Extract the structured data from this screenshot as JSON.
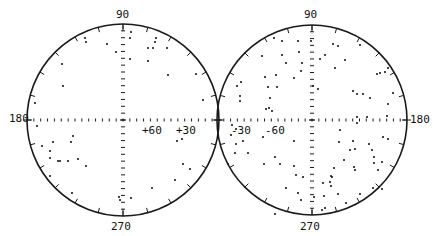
{
  "figure": {
    "colors": {
      "ink": "#1a1a1a",
      "background": "#ffffff"
    },
    "panels": [
      {
        "id": "left",
        "center": [
          123,
          120
        ],
        "radius": 96,
        "labels": {
          "top": "90",
          "bottom": "270",
          "left": "180",
          "lat_a": "+60",
          "lat_b": "+30"
        },
        "points": [
          [
            85,
            38
          ],
          [
            86,
            42
          ],
          [
            107,
            44
          ],
          [
            116,
            52
          ],
          [
            62,
            64
          ],
          [
            63,
            86
          ],
          [
            35,
            103
          ],
          [
            131,
            32
          ],
          [
            130,
            38
          ],
          [
            156,
            38
          ],
          [
            155,
            42
          ],
          [
            148,
            48
          ],
          [
            153,
            48
          ],
          [
            167,
            48
          ],
          [
            130,
            59
          ],
          [
            148,
            61
          ],
          [
            168,
            75
          ],
          [
            196,
            74
          ],
          [
            203,
            100
          ],
          [
            37,
            126
          ],
          [
            42,
            146
          ],
          [
            53,
            142
          ],
          [
            50,
            151
          ],
          [
            73,
            136
          ],
          [
            71,
            142
          ],
          [
            50,
            158
          ],
          [
            58,
            161
          ],
          [
            60,
            161
          ],
          [
            68,
            161
          ],
          [
            78,
            159
          ],
          [
            86,
            166
          ],
          [
            50,
            176
          ],
          [
            72,
            193
          ],
          [
            119,
            197
          ],
          [
            131,
            198
          ],
          [
            120,
            200
          ],
          [
            177,
            141
          ],
          [
            182,
            139
          ],
          [
            183,
            164
          ],
          [
            190,
            169
          ],
          [
            175,
            180
          ],
          [
            152,
            188
          ]
        ]
      },
      {
        "id": "right",
        "center": [
          312,
          120
        ],
        "radius": 95,
        "labels": {
          "top": "90",
          "bottom": "270",
          "right": "180",
          "lat_a": "-30",
          "lat_b": "-60"
        },
        "points": [
          [
            274,
            38
          ],
          [
            282,
            41
          ],
          [
            298,
            41
          ],
          [
            311,
            41
          ],
          [
            262,
            56
          ],
          [
            282,
            55
          ],
          [
            299,
            52
          ],
          [
            286,
            63
          ],
          [
            302,
            63
          ],
          [
            301,
            71
          ],
          [
            265,
            77
          ],
          [
            276,
            75
          ],
          [
            241,
            82
          ],
          [
            237,
            86
          ],
          [
            268,
            87
          ],
          [
            277,
            87
          ],
          [
            294,
            78
          ],
          [
            240,
            96
          ],
          [
            240,
            101
          ],
          [
            270,
            98
          ],
          [
            269,
            108
          ],
          [
            266,
            109
          ],
          [
            272,
            111
          ],
          [
            333,
            44
          ],
          [
            338,
            46
          ],
          [
            360,
            45
          ],
          [
            325,
            55
          ],
          [
            320,
            59
          ],
          [
            345,
            60
          ],
          [
            335,
            68
          ],
          [
            380,
            73
          ],
          [
            385,
            72
          ],
          [
            377,
            74
          ],
          [
            388,
            68
          ],
          [
            313,
            86
          ],
          [
            318,
            89
          ],
          [
            353,
            91
          ],
          [
            357,
            94
          ],
          [
            363,
            94
          ],
          [
            370,
            98
          ],
          [
            393,
            93
          ],
          [
            388,
            104
          ],
          [
            387,
            116
          ],
          [
            367,
            117
          ],
          [
            357,
            117
          ],
          [
            232,
            125
          ],
          [
            236,
            129
          ],
          [
            231,
            135
          ],
          [
            243,
            141
          ],
          [
            236,
            144
          ],
          [
            235,
            153
          ],
          [
            248,
            153
          ],
          [
            263,
            137
          ],
          [
            294,
            141
          ],
          [
            280,
            164
          ],
          [
            264,
            164
          ],
          [
            275,
            157
          ],
          [
            294,
            166
          ],
          [
            296,
            175
          ],
          [
            303,
            177
          ],
          [
            298,
            193
          ],
          [
            286,
            188
          ],
          [
            275,
            214
          ],
          [
            301,
            200
          ],
          [
            228,
            164
          ],
          [
            357,
            123
          ],
          [
            340,
            130
          ],
          [
            383,
            137
          ],
          [
            388,
            139
          ],
          [
            339,
            142
          ],
          [
            353,
            141
          ],
          [
            350,
            150
          ],
          [
            355,
            149
          ],
          [
            369,
            144
          ],
          [
            372,
            150
          ],
          [
            374,
            157
          ],
          [
            374,
            163
          ],
          [
            344,
            160
          ],
          [
            354,
            167
          ],
          [
            355,
            170
          ],
          [
            334,
            168
          ],
          [
            331,
            176
          ],
          [
            332,
            177
          ],
          [
            378,
            170
          ],
          [
            382,
            162
          ],
          [
            382,
            189
          ],
          [
            373,
            188
          ],
          [
            360,
            194
          ],
          [
            330,
            182
          ],
          [
            323,
            183
          ],
          [
            324,
            196
          ],
          [
            338,
            194
          ],
          [
            346,
            203
          ],
          [
            325,
            208
          ],
          [
            314,
            197
          ],
          [
            331,
            186
          ],
          [
            322,
            210
          ]
        ]
      }
    ]
  }
}
